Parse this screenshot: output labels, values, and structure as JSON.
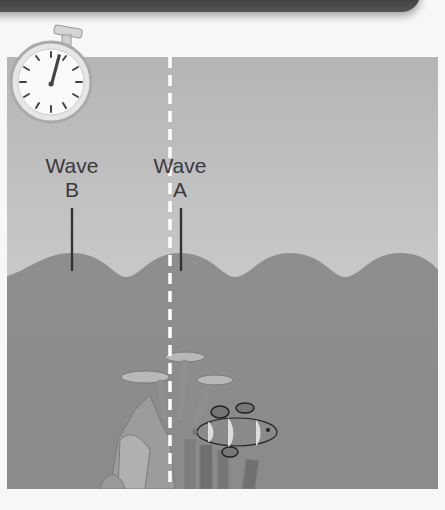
{
  "labels": {
    "wave_b": {
      "line1": "Wave",
      "line2": "B"
    },
    "wave_a": {
      "line1": "Wave",
      "line2": "A"
    }
  },
  "stopwatch": {
    "icon": "stopwatch-icon",
    "hand_position": "just past 12 o'clock"
  },
  "colors": {
    "air": "#c4c4c4",
    "water": "#8f8f8f",
    "marker": "#333333",
    "reference_line": "#ffffff",
    "background": "#f7f7f7"
  },
  "waves": {
    "crest_x": [
      72,
      180,
      290,
      400
    ],
    "crest_y": 253,
    "trough_y": 277,
    "period_px": 109
  },
  "reference_line_x": 170,
  "scene_objects": [
    "coral",
    "clownfish"
  ]
}
